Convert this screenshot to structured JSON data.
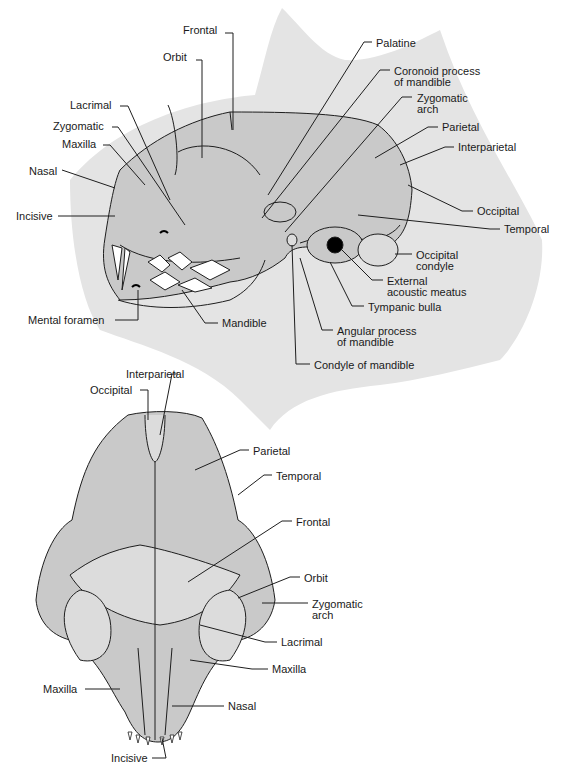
{
  "colors": {
    "background": "#ffffff",
    "silhouette": "#e4e4e4",
    "bone": "#c9c9c9",
    "bone_light": "#dcdcdc",
    "outline": "#1e1e1e",
    "teeth": "#ffffff",
    "text": "#1a1a1a"
  },
  "lateral_view": {
    "labels": [
      {
        "id": "frontal",
        "text": "Frontal",
        "x": 183,
        "y": 30
      },
      {
        "id": "orbit",
        "text": "Orbit",
        "x": 163,
        "y": 57
      },
      {
        "id": "lacrimal",
        "text": "Lacrimal",
        "x": 70,
        "y": 100
      },
      {
        "id": "zygomatic",
        "text": "Zygomatic",
        "x": 53,
        "y": 122
      },
      {
        "id": "maxilla",
        "text": "Maxilla",
        "x": 62,
        "y": 140
      },
      {
        "id": "nasal",
        "text": "Nasal",
        "x": 29,
        "y": 166
      },
      {
        "id": "incisive",
        "text": "Incisive",
        "x": 16,
        "y": 212
      },
      {
        "id": "mental-foramen",
        "text": "Mental foramen",
        "x": 28,
        "y": 316
      },
      {
        "id": "mandible",
        "text": "Mandible",
        "x": 222,
        "y": 319
      },
      {
        "id": "palatine",
        "text": "Palatine",
        "x": 376,
        "y": 38
      },
      {
        "id": "coronoid-process",
        "text": "Coronoid process",
        "x": 394,
        "y": 66
      },
      {
        "id": "coronoid-process-2",
        "text": "of mandible",
        "x": 394,
        "y": 77
      },
      {
        "id": "zygomatic-arch",
        "text": "Zygomatic",
        "x": 417,
        "y": 93
      },
      {
        "id": "zygomatic-arch-2",
        "text": "arch",
        "x": 417,
        "y": 104
      },
      {
        "id": "parietal",
        "text": "Parietal",
        "x": 442,
        "y": 123
      },
      {
        "id": "interparietal",
        "text": "Interparietal",
        "x": 458,
        "y": 143
      },
      {
        "id": "occipital",
        "text": "Occipital",
        "x": 477,
        "y": 207
      },
      {
        "id": "temporal",
        "text": "Temporal",
        "x": 504,
        "y": 225
      },
      {
        "id": "occipital-condyle",
        "text": "Occipital",
        "x": 416,
        "y": 250
      },
      {
        "id": "occipital-condyle-2",
        "text": "condyle",
        "x": 416,
        "y": 261
      },
      {
        "id": "external-acoustic-meatus",
        "text": "External",
        "x": 387,
        "y": 276
      },
      {
        "id": "external-acoustic-meatus-2",
        "text": "acoustic meatus",
        "x": 387,
        "y": 287
      },
      {
        "id": "tympanic-bulla",
        "text": "Tympanic bulla",
        "x": 368,
        "y": 302
      },
      {
        "id": "angular-process",
        "text": "Angular process",
        "x": 337,
        "y": 326
      },
      {
        "id": "angular-process-2",
        "text": "of mandible",
        "x": 337,
        "y": 337
      },
      {
        "id": "condyle-of-mandible",
        "text": "Condyle of mandible",
        "x": 314,
        "y": 360
      }
    ]
  },
  "dorsal_view": {
    "labels": [
      {
        "id": "interparietal",
        "text": "Interparietal",
        "x": 126,
        "y": 370
      },
      {
        "id": "occipital",
        "text": "Occipital",
        "x": 90,
        "y": 386
      },
      {
        "id": "parietal",
        "text": "Parietal",
        "x": 253,
        "y": 446
      },
      {
        "id": "temporal",
        "text": "Temporal",
        "x": 276,
        "y": 471
      },
      {
        "id": "frontal",
        "text": "Frontal",
        "x": 296,
        "y": 517
      },
      {
        "id": "orbit",
        "text": "Orbit",
        "x": 304,
        "y": 573
      },
      {
        "id": "zygomatic-arch",
        "text": "Zygomatic",
        "x": 312,
        "y": 599
      },
      {
        "id": "zygomatic-arch-2",
        "text": "arch",
        "x": 312,
        "y": 610
      },
      {
        "id": "lacrimal",
        "text": "Lacrimal",
        "x": 281,
        "y": 638
      },
      {
        "id": "maxilla-right",
        "text": "Maxilla",
        "x": 272,
        "y": 665
      },
      {
        "id": "maxilla-left",
        "text": "Maxilla",
        "x": 43,
        "y": 685
      },
      {
        "id": "nasal",
        "text": "Nasal",
        "x": 228,
        "y": 702
      },
      {
        "id": "incisive",
        "text": "Incisive",
        "x": 111,
        "y": 754
      }
    ]
  }
}
